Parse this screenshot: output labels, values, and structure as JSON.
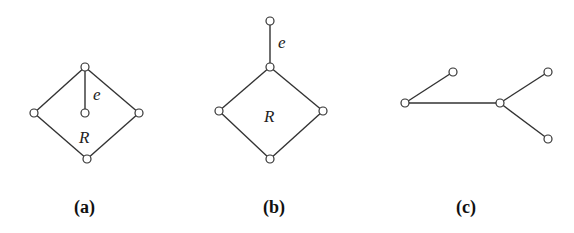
{
  "figure": {
    "panels": [
      {
        "id": "a",
        "caption": "(a)",
        "edge_label": "e",
        "region_label": "R",
        "nodes": [
          [
            85,
            67
          ],
          [
            34,
            113
          ],
          [
            139,
            113
          ],
          [
            87,
            159
          ],
          [
            85,
            113
          ]
        ],
        "edges": [
          [
            0,
            1
          ],
          [
            0,
            2
          ],
          [
            1,
            3
          ],
          [
            2,
            3
          ],
          [
            0,
            4
          ]
        ]
      },
      {
        "id": "b",
        "caption": "(b)",
        "edge_label": "e",
        "region_label": "R",
        "nodes": [
          [
            270,
            21
          ],
          [
            270,
            67
          ],
          [
            219,
            111
          ],
          [
            323,
            111
          ],
          [
            270,
            159
          ]
        ],
        "edges": [
          [
            0,
            1
          ],
          [
            1,
            2
          ],
          [
            1,
            3
          ],
          [
            2,
            4
          ],
          [
            3,
            4
          ]
        ]
      },
      {
        "id": "c",
        "caption": "(c)",
        "nodes": [
          [
            405,
            103
          ],
          [
            453,
            72
          ],
          [
            500,
            103
          ],
          [
            548,
            72
          ],
          [
            548,
            139
          ]
        ],
        "edges": [
          [
            0,
            1
          ],
          [
            0,
            2
          ],
          [
            2,
            3
          ],
          [
            2,
            4
          ]
        ]
      }
    ]
  }
}
